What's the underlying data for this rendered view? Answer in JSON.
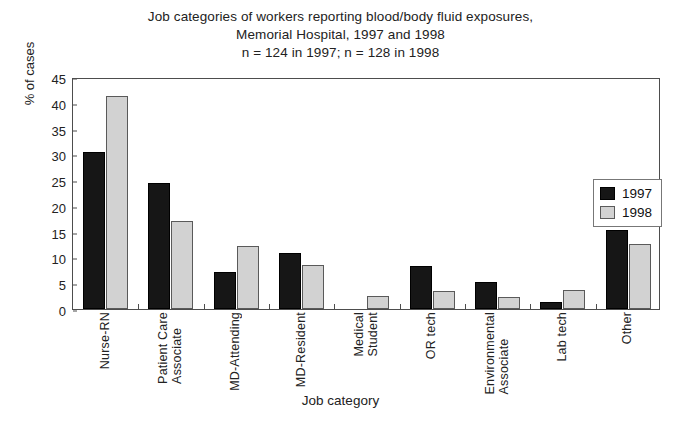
{
  "chart_data": {
    "type": "bar",
    "title": "Job categories of workers reporting blood/body fluid exposures, Memorial Hospital, 1997 and 1998\nn = 124 in 1997; n = 128 in 1998",
    "title_lines": [
      "Job categories of workers reporting blood/body fluid exposures,",
      "Memorial Hospital, 1997 and 1998",
      "n = 124 in 1997; n = 128 in 1998"
    ],
    "xlabel": "Job category",
    "ylabel": "% of cases",
    "ylim": [
      0,
      45
    ],
    "yticks": [
      0,
      5,
      10,
      15,
      20,
      25,
      30,
      35,
      40,
      45
    ],
    "ytick_labels": [
      "0",
      "5",
      "10",
      "15",
      "20",
      "25",
      "30",
      "35",
      "40",
      "45"
    ],
    "grid": false,
    "legend_position": "upper right",
    "categories": [
      "Nurse-RN",
      "Patient Care Associate",
      "MD-Attending",
      "MD-Resident",
      "Medical Student",
      "OR tech",
      "Environmental Associate",
      "Lab tech",
      "Other"
    ],
    "category_label_lines": [
      [
        "Nurse-RN"
      ],
      [
        "Patient Care",
        "Associate"
      ],
      [
        "MD-Attending"
      ],
      [
        "MD-Resident"
      ],
      [
        "Medical",
        "Student"
      ],
      [
        "OR tech"
      ],
      [
        "Environmental",
        "Associate"
      ],
      [
        "Lab tech"
      ],
      [
        "Other"
      ]
    ],
    "series": [
      {
        "name": "1997",
        "color": "#161616",
        "values": [
          30.4,
          24.4,
          7.2,
          10.9,
          0.0,
          8.4,
          5.3,
          1.4,
          15.4
        ]
      },
      {
        "name": "1998",
        "color": "#d2d2d2",
        "values": [
          41.4,
          17.1,
          12.3,
          8.5,
          2.5,
          3.5,
          2.4,
          3.6,
          12.6
        ]
      }
    ]
  },
  "legend": {
    "entries": [
      {
        "label": "1997"
      },
      {
        "label": "1998"
      }
    ]
  }
}
